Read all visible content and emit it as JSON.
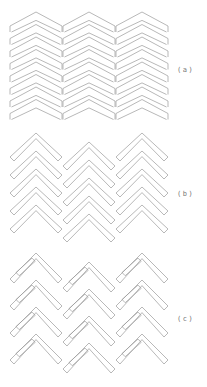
{
  "figure": {
    "background": "#ffffff",
    "line_color": "#9a9a9a",
    "panels": [
      {
        "id": "a",
        "label": "(a)",
        "label_pos": {
          "x": 177,
          "y": 66
        },
        "style": "flat-chevron",
        "columns": [
          {
            "x": 10,
            "y": 12,
            "width": 52,
            "count": 8,
            "pitch": 12.5,
            "rise": 14,
            "side": 6
          },
          {
            "x": 63,
            "y": 12,
            "width": 52,
            "count": 8,
            "pitch": 12.5,
            "rise": 14,
            "side": 6
          },
          {
            "x": 116,
            "y": 12,
            "width": 52,
            "count": 8,
            "pitch": 12.5,
            "rise": 14,
            "side": 6
          }
        ]
      },
      {
        "id": "b",
        "label": "(b)",
        "label_pos": {
          "x": 177,
          "y": 190
        },
        "style": "steep-chevron",
        "columns": [
          {
            "x": 10,
            "y": 133,
            "width": 52,
            "count": 5,
            "pitch": 18,
            "rise": 24,
            "thick": 4
          },
          {
            "x": 63,
            "y": 142,
            "width": 52,
            "count": 5,
            "pitch": 18,
            "rise": 24,
            "thick": 4
          },
          {
            "x": 116,
            "y": 133,
            "width": 52,
            "count": 5,
            "pitch": 18,
            "rise": 24,
            "thick": 4
          }
        ]
      },
      {
        "id": "c",
        "label": "(c)",
        "label_pos": {
          "x": 177,
          "y": 315
        },
        "style": "interlock-chevron",
        "columns": [
          {
            "x": 10,
            "y": 253,
            "width": 52,
            "count": 4,
            "pitch": 27,
            "rise": 26,
            "thick": 4
          },
          {
            "x": 63,
            "y": 262,
            "width": 52,
            "count": 4,
            "pitch": 27,
            "rise": 26,
            "thick": 4
          },
          {
            "x": 116,
            "y": 253,
            "width": 52,
            "count": 4,
            "pitch": 27,
            "rise": 26,
            "thick": 4
          }
        ]
      }
    ]
  }
}
